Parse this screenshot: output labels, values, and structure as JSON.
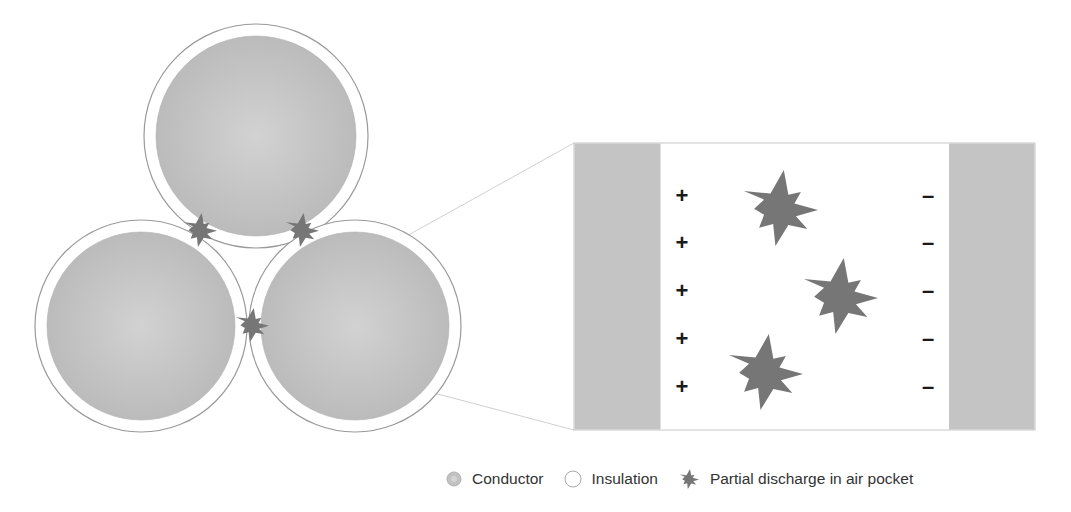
{
  "colors": {
    "conductor": "#bdbdbd",
    "conductor_highlight": "#d2d2d2",
    "insulation": "#ffffff",
    "outline": "#9a9a9a",
    "discharge": "#767676",
    "sign": "#1a1a1a",
    "guide_line": "#cfcfcf"
  },
  "cable_cross_section": {
    "cores": [
      {
        "name": "top-core",
        "cx": 256,
        "cy": 136,
        "outer_r": 112,
        "inner_r": 100
      },
      {
        "name": "bottom-left-core",
        "cx": 141,
        "cy": 326,
        "outer_r": 106,
        "inner_r": 94
      },
      {
        "name": "bottom-right-core",
        "cx": 355,
        "cy": 326,
        "outer_r": 106,
        "inner_r": 94
      }
    ],
    "discharges": [
      {
        "cx": 200,
        "cy": 230,
        "size": 17
      },
      {
        "cx": 302,
        "cy": 230,
        "size": 17
      },
      {
        "cx": 252,
        "cy": 325,
        "size": 17
      }
    ]
  },
  "zoom_detail": {
    "box": {
      "x": 574,
      "y": 143,
      "w": 461,
      "h": 287
    },
    "left_band_w": 86,
    "right_band_w": 86,
    "plus_signs": [
      "+",
      "+",
      "+",
      "+",
      "+"
    ],
    "minus_signs": [
      "–",
      "–",
      "–",
      "–",
      "–"
    ],
    "sign_rows_y": [
      195,
      242,
      290,
      338,
      386
    ],
    "plus_x": 682,
    "minus_x": 928,
    "discharges": [
      {
        "cx": 780,
        "cy": 208,
        "size": 38
      },
      {
        "cx": 840,
        "cy": 296,
        "size": 38
      },
      {
        "cx": 765,
        "cy": 372,
        "size": 38
      }
    ]
  },
  "legend": {
    "items": [
      {
        "icon": "conductor-swatch-icon",
        "label": "Conductor"
      },
      {
        "icon": "insulation-swatch-icon",
        "label": "Insulation"
      },
      {
        "icon": "discharge-star-icon",
        "label": "Partial discharge in air pocket"
      }
    ]
  }
}
